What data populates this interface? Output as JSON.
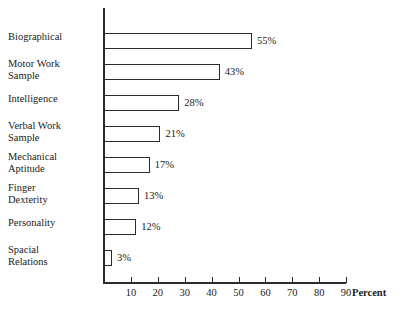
{
  "chart_data": {
    "type": "bar",
    "orientation": "horizontal",
    "title": "",
    "xlabel": "Percent",
    "ylabel": "",
    "xlim": [
      0,
      90
    ],
    "xticks": [
      10,
      20,
      30,
      40,
      50,
      60,
      70,
      80,
      90
    ],
    "grid": false,
    "legend": null,
    "categories": [
      "Biographical",
      "Motor Work Sample",
      "Intelligence",
      "Verbal Work Sample",
      "Mechanical Aptitude",
      "Finger Dexterity",
      "Personality",
      "Spacial Relations"
    ],
    "values": [
      55,
      43,
      28,
      21,
      17,
      13,
      12,
      3
    ],
    "value_labels": [
      "55%",
      "43%",
      "28%",
      "21%",
      "17%",
      "13%",
      "12%",
      "3%"
    ],
    "bars": [
      {
        "label_line1": "Biographical",
        "label_line2": "",
        "value": 55,
        "value_label": "55%"
      },
      {
        "label_line1": "Motor Work",
        "label_line2": "Sample",
        "value": 43,
        "value_label": "43%"
      },
      {
        "label_line1": "Intelligence",
        "label_line2": "",
        "value": 28,
        "value_label": "28%"
      },
      {
        "label_line1": "Verbal Work",
        "label_line2": "Sample",
        "value": 21,
        "value_label": "21%"
      },
      {
        "label_line1": "Mechanical",
        "label_line2": "Aptitude",
        "value": 17,
        "value_label": "17%"
      },
      {
        "label_line1": "Finger",
        "label_line2": "Dexterity",
        "value": 13,
        "value_label": "13%"
      },
      {
        "label_line1": "Personality",
        "label_line2": "",
        "value": 12,
        "value_label": "12%"
      },
      {
        "label_line1": "Spacial",
        "label_line2": "Relations",
        "value": 3,
        "value_label": "3%"
      }
    ],
    "colors": {
      "bar_fill": "#ffffff",
      "bar_stroke": "#2b2b2b",
      "axis": "#2b2b2b",
      "text": "#1b1b1b",
      "background": "#ffffff"
    }
  }
}
